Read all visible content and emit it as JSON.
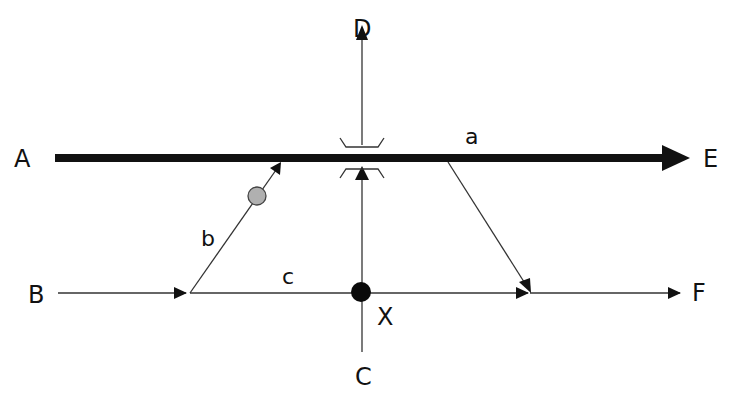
{
  "diagram": {
    "nodes": {
      "A": "A",
      "B": "B",
      "C": "C",
      "D": "D",
      "E": "E",
      "F": "F",
      "X": "X"
    },
    "edge_labels": {
      "a": "a",
      "b": "b",
      "c": "c"
    },
    "colors": {
      "line": "#111111",
      "marker_fill": "#b0b0b0"
    },
    "edges": [
      {
        "from": "A",
        "to": "E",
        "style": "thick"
      },
      {
        "from": "B",
        "to": "F",
        "style": "thin",
        "label": "c"
      },
      {
        "from": "C",
        "to": "D",
        "style": "thin",
        "through": "X",
        "crossing": "bridge over A-E"
      },
      {
        "from": "B-line",
        "to": "A-E",
        "style": "thin",
        "label": "b",
        "marker": "gray circle"
      },
      {
        "from": "A-E",
        "to": "B-F",
        "style": "thin",
        "label": "a"
      }
    ]
  }
}
